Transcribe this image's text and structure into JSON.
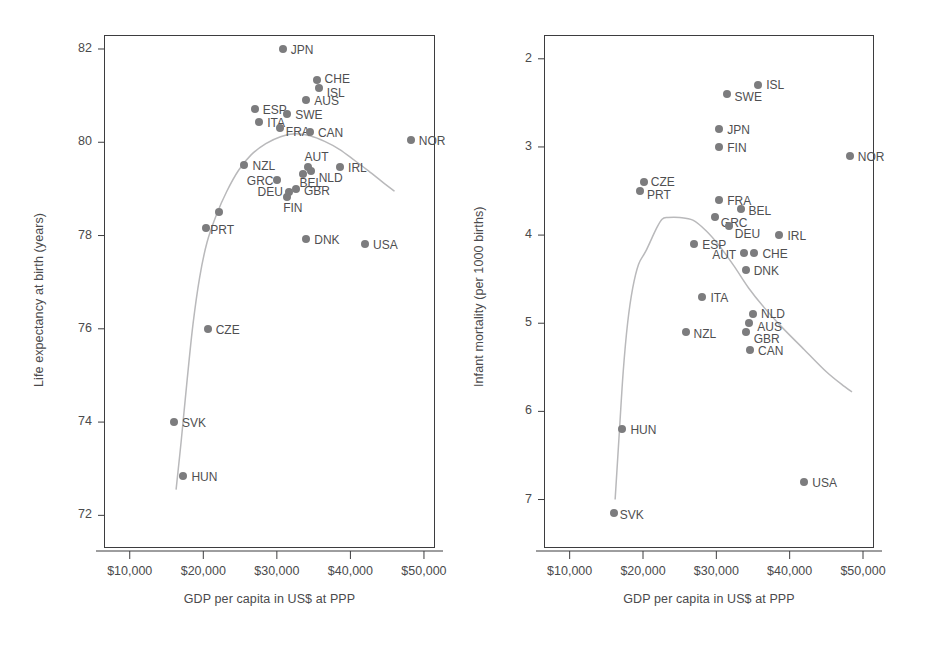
{
  "figure": {
    "background": "#ffffff",
    "point_color": "#7c7c7e",
    "curve_color": "#b9b9bb",
    "axis_color": "#3d3d3f",
    "text_color": "#4a4a4c"
  },
  "chart_data": [
    {
      "id": "life-expectancy-panel",
      "type": "scatter",
      "title": "",
      "xlabel": "GDP per capita in US$ at PPP",
      "ylabel": "Life expectancy at birth (years)",
      "xlim": [
        6500,
        51500
      ],
      "ylim": [
        71.3,
        82.3
      ],
      "xticks": [
        10000,
        20000,
        30000,
        40000,
        50000
      ],
      "xticklabels": [
        "$10,000",
        "$20,000",
        "$30,000",
        "$40,000",
        "$50,000"
      ],
      "yticks": [
        72,
        74,
        76,
        78,
        80,
        82
      ],
      "yticklabels": [
        "72",
        "74",
        "76",
        "78",
        "80",
        "82"
      ],
      "grid": false,
      "legend": "none",
      "has_smoothed_fit_curve": true,
      "points": [
        {
          "label": "JPN",
          "x": 30800,
          "y": 82.0,
          "lx": 8,
          "ly": -5
        },
        {
          "label": "CHE",
          "x": 35400,
          "y": 81.33,
          "lx": 8,
          "ly": -7
        },
        {
          "label": "ISL",
          "x": 35700,
          "y": 81.17,
          "lx": 8,
          "ly": -1
        },
        {
          "label": "AUS",
          "x": 34000,
          "y": 80.9,
          "lx": 8,
          "ly": -5
        },
        {
          "label": "ESP",
          "x": 27000,
          "y": 80.72,
          "lx": 8,
          "ly": -5
        },
        {
          "label": "SWE",
          "x": 31400,
          "y": 80.6,
          "lx": 8,
          "ly": -5
        },
        {
          "label": "ITA",
          "x": 27600,
          "y": 80.43,
          "lx": 8,
          "ly": -5
        },
        {
          "label": "FRA",
          "x": 30400,
          "y": 80.3,
          "lx": 6,
          "ly": -2
        },
        {
          "label": "CAN",
          "x": 34500,
          "y": 80.22,
          "lx": 8,
          "ly": -5
        },
        {
          "label": "NOR",
          "x": 48200,
          "y": 80.05,
          "lx": 8,
          "ly": -5
        },
        {
          "label": "NZL",
          "x": 25600,
          "y": 79.52,
          "lx": 8,
          "ly": -5
        },
        {
          "label": "IRL",
          "x": 38600,
          "y": 79.48,
          "lx": 8,
          "ly": -5
        },
        {
          "label": "AUT",
          "x": 34300,
          "y": 79.46,
          "lx": -4,
          "ly": -16
        },
        {
          "label": "NLD",
          "x": 34600,
          "y": 79.38,
          "lx": 8,
          "ly": 1
        },
        {
          "label": "BEL",
          "x": 33500,
          "y": 79.33,
          "lx": -3,
          "ly": 3
        },
        {
          "label": "GRC",
          "x": 30000,
          "y": 79.2,
          "lx": -30,
          "ly": -5
        },
        {
          "label": "GBR",
          "x": 32600,
          "y": 79.0,
          "lx": 8,
          "ly": -4
        },
        {
          "label": "DEU",
          "x": 31600,
          "y": 78.93,
          "lx": -31,
          "ly": -6
        },
        {
          "label": "FIN",
          "x": 31400,
          "y": 78.82,
          "lx": -4,
          "ly": 5
        },
        {
          "label": "LUX",
          "x": 22100,
          "y": 78.51,
          "lx": 0,
          "ly": 0,
          "hide_label": true
        },
        {
          "label": "PRT",
          "x": 20400,
          "y": 78.17,
          "lx": 4,
          "ly": -4
        },
        {
          "label": "DNK",
          "x": 34000,
          "y": 77.92,
          "lx": 8,
          "ly": -5
        },
        {
          "label": "USA",
          "x": 42000,
          "y": 77.82,
          "lx": 8,
          "ly": -5
        },
        {
          "label": "CZE",
          "x": 20600,
          "y": 76.0,
          "lx": 8,
          "ly": -5
        },
        {
          "label": "SVK",
          "x": 16000,
          "y": 74.0,
          "lx": 8,
          "ly": -5
        },
        {
          "label": "HUN",
          "x": 17300,
          "y": 72.85,
          "lx": 8,
          "ly": -5
        }
      ],
      "fit_curve": [
        [
          16300,
          72.55
        ],
        [
          17000,
          73.6
        ],
        [
          17800,
          74.9
        ],
        [
          18600,
          76.1
        ],
        [
          19500,
          77.1
        ],
        [
          20500,
          77.85
        ],
        [
          21800,
          78.45
        ],
        [
          23200,
          78.95
        ],
        [
          24800,
          79.4
        ],
        [
          26500,
          79.73
        ],
        [
          28500,
          79.97
        ],
        [
          30500,
          80.12
        ],
        [
          32500,
          80.18
        ],
        [
          34500,
          80.14
        ],
        [
          36500,
          80.02
        ],
        [
          38500,
          79.85
        ],
        [
          40500,
          79.62
        ],
        [
          42500,
          79.38
        ],
        [
          44500,
          79.13
        ],
        [
          46000,
          78.95
        ]
      ]
    },
    {
      "id": "infant-mortality-panel",
      "type": "scatter",
      "title": "",
      "xlabel": "GDP per capita in US$ at PPP",
      "ylabel": "Infant mortality (per 1000 births)",
      "xlim": [
        6500,
        51500
      ],
      "ylim": [
        1.73,
        7.55
      ],
      "xticks": [
        10000,
        20000,
        30000,
        40000,
        50000
      ],
      "xticklabels": [
        "$10,000",
        "$20,000",
        "$30,000",
        "$40,000",
        "$50,000"
      ],
      "yticks": [
        2,
        3,
        4,
        5,
        6,
        7
      ],
      "yticklabels": [
        "2",
        "3",
        "4",
        "5",
        "6",
        "7"
      ],
      "grid": false,
      "legend": "none",
      "y_axis_inverted": true,
      "has_smoothed_fit_curve": true,
      "points": [
        {
          "label": "ISL",
          "x": 35700,
          "y": 2.3,
          "lx": 8,
          "ly": -6
        },
        {
          "label": "SWE",
          "x": 31400,
          "y": 2.4,
          "lx": 8,
          "ly": -3
        },
        {
          "label": "JPN",
          "x": 30400,
          "y": 2.8,
          "lx": 8,
          "ly": -5
        },
        {
          "label": "FIN",
          "x": 30400,
          "y": 3.0,
          "lx": 8,
          "ly": -5
        },
        {
          "label": "NOR",
          "x": 48200,
          "y": 3.1,
          "lx": 8,
          "ly": -5
        },
        {
          "label": "CZE",
          "x": 20100,
          "y": 3.4,
          "lx": 7,
          "ly": -6
        },
        {
          "label": "PRT",
          "x": 19600,
          "y": 3.5,
          "lx": 7,
          "ly": -2
        },
        {
          "label": "FRA",
          "x": 30400,
          "y": 3.6,
          "lx": 8,
          "ly": -5
        },
        {
          "label": "BEL",
          "x": 33300,
          "y": 3.7,
          "lx": 8,
          "ly": -4
        },
        {
          "label": "GRC",
          "x": 29800,
          "y": 3.8,
          "lx": 6,
          "ly": 0
        },
        {
          "label": "DEU",
          "x": 31700,
          "y": 3.9,
          "lx": 6,
          "ly": 2
        },
        {
          "label": "IRL",
          "x": 38600,
          "y": 4.0,
          "lx": 8,
          "ly": -5
        },
        {
          "label": "ESP",
          "x": 27000,
          "y": 4.1,
          "lx": 8,
          "ly": -5
        },
        {
          "label": "AUT",
          "x": 33800,
          "y": 4.2,
          "lx": -32,
          "ly": -4
        },
        {
          "label": "CHE",
          "x": 35200,
          "y": 4.2,
          "lx": 8,
          "ly": -5
        },
        {
          "label": "DNK",
          "x": 34000,
          "y": 4.4,
          "lx": 8,
          "ly": -5
        },
        {
          "label": "ITA",
          "x": 28100,
          "y": 4.7,
          "lx": 8,
          "ly": -5
        },
        {
          "label": "NLD",
          "x": 35000,
          "y": 4.9,
          "lx": 8,
          "ly": -6
        },
        {
          "label": "AUS",
          "x": 34500,
          "y": 5.0,
          "lx": 8,
          "ly": -2
        },
        {
          "label": "NZL",
          "x": 25800,
          "y": 5.1,
          "lx": 8,
          "ly": -4
        },
        {
          "label": "GBR",
          "x": 34000,
          "y": 5.1,
          "lx": 8,
          "ly": 1
        },
        {
          "label": "CAN",
          "x": 34600,
          "y": 5.3,
          "lx": 8,
          "ly": -5
        },
        {
          "label": "HUN",
          "x": 17200,
          "y": 6.2,
          "lx": 8,
          "ly": -5
        },
        {
          "label": "USA",
          "x": 42000,
          "y": 6.8,
          "lx": 8,
          "ly": -5
        },
        {
          "label": "SVK",
          "x": 16000,
          "y": 7.15,
          "lx": 6,
          "ly": -4
        }
      ],
      "fit_curve": [
        [
          16200,
          7.0
        ],
        [
          16800,
          6.2
        ],
        [
          17300,
          5.55
        ],
        [
          17900,
          5.0
        ],
        [
          18600,
          4.6
        ],
        [
          19400,
          4.33
        ],
        [
          20400,
          4.18
        ],
        [
          21800,
          3.93
        ],
        [
          22600,
          3.82
        ],
        [
          23400,
          3.8
        ],
        [
          25000,
          3.8
        ],
        [
          26800,
          3.83
        ],
        [
          28600,
          3.95
        ],
        [
          30400,
          4.12
        ],
        [
          32400,
          4.35
        ],
        [
          34400,
          4.6
        ],
        [
          36500,
          4.82
        ],
        [
          39000,
          5.05
        ],
        [
          42000,
          5.3
        ],
        [
          45000,
          5.55
        ],
        [
          47500,
          5.72
        ],
        [
          48500,
          5.78
        ]
      ]
    }
  ]
}
